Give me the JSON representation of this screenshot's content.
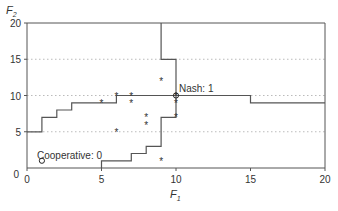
{
  "chart_data": {
    "type": "line",
    "title": "",
    "xlabel": "F1",
    "ylabel": "F2",
    "xlim": [
      0,
      20
    ],
    "ylim": [
      0,
      20
    ],
    "xticks": [
      0,
      5,
      10,
      15,
      20
    ],
    "yticks": [
      0,
      5,
      10,
      15,
      20
    ],
    "x_tick_labels": [
      "0",
      "5",
      "10",
      "15",
      "20"
    ],
    "y_tick_labels": [
      "0",
      "5",
      "10",
      "15",
      "20"
    ],
    "grid": {
      "horizontal_dotted": [
        5,
        10,
        15
      ],
      "vertical": false
    },
    "series": [
      {
        "name": "best-response-1",
        "style": "step",
        "points": [
          [
            0,
            5
          ],
          [
            1,
            5
          ],
          [
            1,
            7
          ],
          [
            2,
            7
          ],
          [
            2,
            8
          ],
          [
            3,
            8
          ],
          [
            3,
            9
          ],
          [
            6,
            9
          ],
          [
            6,
            10
          ],
          [
            15,
            10
          ],
          [
            15,
            9
          ],
          [
            20,
            9
          ]
        ]
      },
      {
        "name": "best-response-2",
        "style": "step",
        "points": [
          [
            5,
            0
          ],
          [
            5,
            1
          ],
          [
            7,
            1
          ],
          [
            7,
            2
          ],
          [
            8,
            2
          ],
          [
            8,
            3
          ],
          [
            9,
            3
          ],
          [
            9,
            7
          ],
          [
            10,
            7
          ],
          [
            10,
            15
          ],
          [
            9,
            15
          ],
          [
            9,
            20
          ]
        ]
      },
      {
        "name": "outcomes",
        "style": "scatter",
        "marker": "star",
        "points": [
          [
            5,
            9
          ],
          [
            6,
            10
          ],
          [
            7,
            10
          ],
          [
            7,
            9
          ],
          [
            8,
            7
          ],
          [
            8,
            6
          ],
          [
            6,
            5
          ],
          [
            9,
            1
          ],
          [
            10,
            9
          ],
          [
            10,
            7
          ],
          [
            9,
            12
          ],
          [
            10,
            10
          ]
        ]
      }
    ],
    "annotations": [
      {
        "label": "Nash: 1",
        "x": 10,
        "y": 10,
        "marker": "circle"
      },
      {
        "label": "Cooperative: 0",
        "x": 1,
        "y": 1,
        "marker": "circle"
      }
    ],
    "legend": null
  },
  "labels": {
    "y_axis": "F",
    "y_axis_sub": "2",
    "x_axis": "F",
    "x_axis_sub": "1",
    "nash": "Nash: 1",
    "cooperative": "Cooperative: 0"
  },
  "colors": {
    "line": "#555555",
    "grid": "#bbbbbb",
    "text": "#333333"
  }
}
